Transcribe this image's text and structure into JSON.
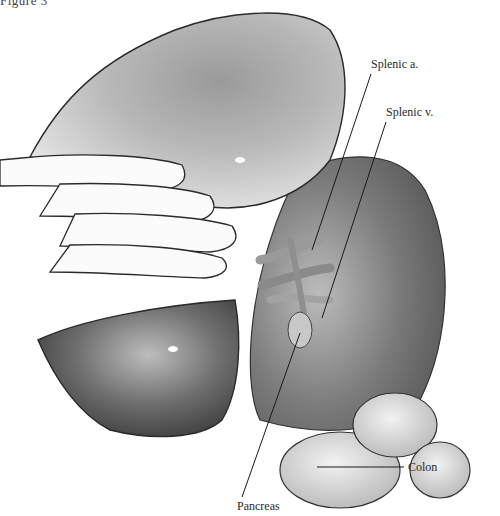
{
  "figure": {
    "title": "Figure 3"
  },
  "labels": [
    {
      "id": "splenic-artery",
      "text": "Splenic a.",
      "x": 371,
      "y": 57,
      "line": [
        371,
        74,
        312,
        250
      ]
    },
    {
      "id": "splenic-vein",
      "text": "Splenic v.",
      "x": 386,
      "y": 105,
      "line": [
        386,
        122,
        322,
        318
      ]
    },
    {
      "id": "colon",
      "text": "Colon",
      "x": 408,
      "y": 461,
      "line": [
        404,
        467,
        317,
        467
      ]
    },
    {
      "id": "pancreas",
      "text": "Pancreas",
      "x": 237,
      "y": 500,
      "line": [
        242,
        497,
        300,
        333
      ]
    }
  ],
  "colors": {
    "background": "#ffffff",
    "ink": "#2a2a2a",
    "organ_dark": "#4a4a4a",
    "organ_mid": "#8c8c8c",
    "organ_light": "#d6d6d6"
  }
}
